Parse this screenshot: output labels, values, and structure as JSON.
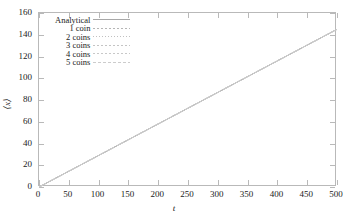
{
  "chart_data": {
    "type": "line",
    "title": "",
    "xlabel": "t",
    "ylabel": "⟨x⟩",
    "xlim": [
      0,
      500
    ],
    "ylim": [
      0,
      160
    ],
    "grid": false,
    "legend_position": "upper-left-inside",
    "xticks": [
      0,
      50,
      100,
      150,
      200,
      250,
      300,
      350,
      400,
      450,
      500
    ],
    "yticks": [
      0,
      20,
      40,
      60,
      80,
      100,
      120,
      140,
      160
    ],
    "series": [
      {
        "name": "Analytical",
        "style": "solid",
        "color": "#a8a8a8",
        "x": [
          0,
          500
        ],
        "values": [
          0,
          145
        ]
      },
      {
        "name": "1 coin",
        "style": "dashed",
        "color": "#b5b5b5",
        "x": [
          0,
          500
        ],
        "values": [
          0,
          145
        ]
      },
      {
        "name": "2 coins",
        "style": "dotted",
        "color": "#c0c0c0",
        "x": [
          0,
          500
        ],
        "values": [
          0,
          145
        ]
      },
      {
        "name": "3 coins",
        "style": "dash-dot",
        "color": "#c4c4c4",
        "x": [
          0,
          500
        ],
        "values": [
          0,
          145
        ]
      },
      {
        "name": "4 coins",
        "style": "dash-dot-dot",
        "color": "#c8c8c8",
        "x": [
          0,
          500
        ],
        "values": [
          0,
          145
        ]
      },
      {
        "name": "5 coins",
        "style": "long-dash",
        "color": "#cccccc",
        "x": [
          0,
          500
        ],
        "values": [
          0,
          145
        ]
      }
    ]
  },
  "axes": {
    "x_title": "t",
    "y_title": "⟨x⟩",
    "x_tick_labels": [
      "0",
      "50",
      "100",
      "150",
      "200",
      "250",
      "300",
      "350",
      "400",
      "450",
      "500"
    ],
    "y_tick_labels": [
      "0",
      "20",
      "40",
      "60",
      "80",
      "100",
      "120",
      "140",
      "160"
    ],
    "frame_color": "#b9b9b9"
  },
  "legend": {
    "entries": [
      {
        "label": "Analytical"
      },
      {
        "label": "1 coin"
      },
      {
        "label": "2 coins"
      },
      {
        "label": "3 coins"
      },
      {
        "label": "4 coins"
      },
      {
        "label": "5 coins"
      }
    ]
  }
}
